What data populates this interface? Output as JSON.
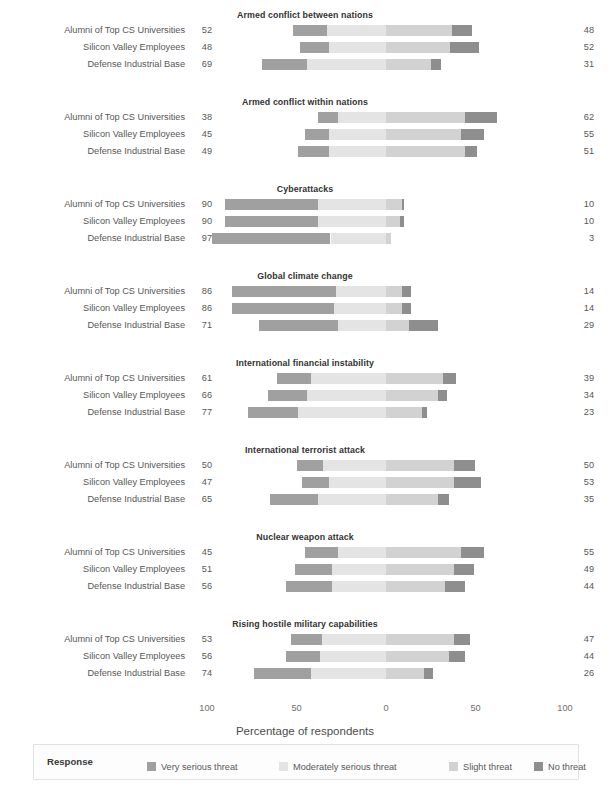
{
  "chart": {
    "title": "",
    "axis_label": "Percentage of respondents",
    "tick_labels": [
      "100",
      "50",
      "0",
      "50",
      "100"
    ],
    "groups": [
      "Alumni of Top CS Universities",
      "Silicon Valley Employees",
      "Defense Industrial Base"
    ]
  },
  "legend": {
    "title": "Response",
    "items": [
      {
        "label": "Very serious threat",
        "color": "#a0a0a0"
      },
      {
        "label": "Moderately serious threat",
        "color": "#e4e4e4"
      },
      {
        "label": "Slight threat",
        "color": "#d2d2d2"
      },
      {
        "label": "No threat",
        "color": "#8e8e8e"
      }
    ]
  },
  "chart_data": {
    "type": "bar",
    "subtype": "diverging-stacked-likert",
    "title": "",
    "xlabel": "Percentage of respondents",
    "ylabel": "",
    "xlim": [
      -100,
      100
    ],
    "xticks": [
      -100,
      -50,
      0,
      50,
      100
    ],
    "xticklabels": [
      "100",
      "50",
      "0",
      "50",
      "100"
    ],
    "grid": false,
    "legend_position": "bottom",
    "legend_title": "Response",
    "categories": [
      "Very serious threat",
      "Moderately serious threat",
      "Slight threat",
      "No threat"
    ],
    "groups": [
      "Alumni of Top CS Universities",
      "Silicon Valley Employees",
      "Defense Industrial Base"
    ],
    "panels": [
      {
        "title": "Armed conflict between nations",
        "rows": [
          {
            "group": "Alumni of Top CS Universities",
            "left_total": 52,
            "right_total": 48,
            "values": [
              19,
              33,
              37,
              11
            ]
          },
          {
            "group": "Silicon Valley Employees",
            "left_total": 48,
            "right_total": 52,
            "values": [
              16,
              32,
              36,
              16
            ]
          },
          {
            "group": "Defense Industrial Base",
            "left_total": 69,
            "right_total": 31,
            "values": [
              25,
              44,
              25,
              6
            ]
          }
        ]
      },
      {
        "title": "Armed conflict within nations",
        "rows": [
          {
            "group": "Alumni of Top CS Universities",
            "left_total": 38,
            "right_total": 62,
            "values": [
              11,
              27,
              44,
              18
            ]
          },
          {
            "group": "Silicon Valley Employees",
            "left_total": 45,
            "right_total": 55,
            "values": [
              13,
              32,
              42,
              13
            ]
          },
          {
            "group": "Defense Industrial Base",
            "left_total": 49,
            "right_total": 51,
            "values": [
              17,
              32,
              44,
              7
            ]
          }
        ]
      },
      {
        "title": "Cyberattacks",
        "rows": [
          {
            "group": "Alumni of Top CS Universities",
            "left_total": 90,
            "right_total": 10,
            "values": [
              52,
              38,
              9,
              1
            ]
          },
          {
            "group": "Silicon Valley Employees",
            "left_total": 90,
            "right_total": 10,
            "values": [
              52,
              38,
              8,
              2
            ]
          },
          {
            "group": "Defense Industrial Base",
            "left_total": 97,
            "right_total": 3,
            "values": [
              66,
              31,
              3,
              0
            ]
          }
        ]
      },
      {
        "title": "Global climate change",
        "rows": [
          {
            "group": "Alumni of Top CS Universities",
            "left_total": 86,
            "right_total": 14,
            "values": [
              58,
              28,
              9,
              5
            ]
          },
          {
            "group": "Silicon Valley Employees",
            "left_total": 86,
            "right_total": 14,
            "values": [
              57,
              29,
              9,
              5
            ]
          },
          {
            "group": "Defense Industrial Base",
            "left_total": 71,
            "right_total": 29,
            "values": [
              44,
              27,
              13,
              16
            ]
          }
        ]
      },
      {
        "title": "International financial instability",
        "rows": [
          {
            "group": "Alumni of Top CS Universities",
            "left_total": 61,
            "right_total": 39,
            "values": [
              19,
              42,
              32,
              7
            ]
          },
          {
            "group": "Silicon Valley Employees",
            "left_total": 66,
            "right_total": 34,
            "values": [
              22,
              44,
              29,
              5
            ]
          },
          {
            "group": "Defense Industrial Base",
            "left_total": 77,
            "right_total": 23,
            "values": [
              28,
              49,
              20,
              3
            ]
          }
        ]
      },
      {
        "title": "International terrorist attack",
        "rows": [
          {
            "group": "Alumni of Top CS Universities",
            "left_total": 50,
            "right_total": 50,
            "values": [
              15,
              35,
              38,
              12
            ]
          },
          {
            "group": "Silicon Valley Employees",
            "left_total": 47,
            "right_total": 53,
            "values": [
              15,
              32,
              38,
              15
            ]
          },
          {
            "group": "Defense Industrial Base",
            "left_total": 65,
            "right_total": 35,
            "values": [
              27,
              38,
              29,
              6
            ]
          }
        ]
      },
      {
        "title": "Nuclear weapon attack",
        "rows": [
          {
            "group": "Alumni of Top CS Universities",
            "left_total": 45,
            "right_total": 55,
            "values": [
              18,
              27,
              42,
              13
            ]
          },
          {
            "group": "Silicon Valley Employees",
            "left_total": 51,
            "right_total": 49,
            "values": [
              21,
              30,
              38,
              11
            ]
          },
          {
            "group": "Defense Industrial Base",
            "left_total": 56,
            "right_total": 44,
            "values": [
              26,
              30,
              33,
              11
            ]
          }
        ]
      },
      {
        "title": "Rising hostile military capabilities",
        "rows": [
          {
            "group": "Alumni of Top CS Universities",
            "left_total": 53,
            "right_total": 47,
            "values": [
              17,
              36,
              38,
              9
            ]
          },
          {
            "group": "Silicon Valley Employees",
            "left_total": 56,
            "right_total": 44,
            "values": [
              19,
              37,
              35,
              9
            ]
          },
          {
            "group": "Defense Industrial Base",
            "left_total": 74,
            "right_total": 26,
            "values": [
              32,
              42,
              21,
              5
            ]
          }
        ]
      }
    ]
  }
}
